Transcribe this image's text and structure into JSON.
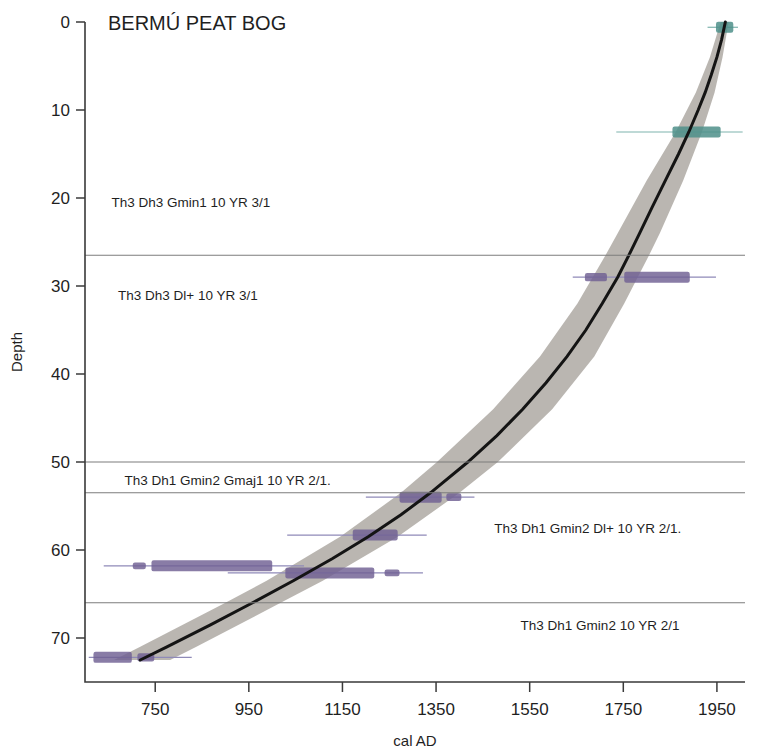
{
  "title": "BERMÚ PEAT BOG",
  "axes": {
    "x": {
      "label": "cal AD",
      "ticks": [
        750,
        950,
        1150,
        1350,
        1550,
        1750,
        1950
      ],
      "min": 600,
      "max": 2010
    },
    "y": {
      "label": "Depth",
      "ticks": [
        0,
        10,
        20,
        30,
        40,
        50,
        60,
        70
      ],
      "min": 0,
      "max": 75
    }
  },
  "stratigraphy": {
    "boundaries": [
      26.5,
      50.0,
      53.5,
      66.0
    ],
    "units": [
      {
        "label": "Th3 Dh3 Gmin1 10 YR 3/1",
        "depth_label": 20.5,
        "align": "left",
        "x_frac": 0.04
      },
      {
        "label": "Th3 Dh3 Dl+ 10 YR 3/1",
        "depth_label": 31.0,
        "align": "left",
        "x_frac": 0.05
      },
      {
        "label": "Th3 Dh1 Gmin2 Gmaj1 10 YR 2/1.",
        "depth_label": 52.0,
        "align": "left",
        "x_frac": 0.06
      },
      {
        "label": "Th3 Dh1 Gmin2 Dl+ 10 YR 2/1.",
        "depth_label": 57.5,
        "align": "left",
        "x_frac": 0.62
      },
      {
        "label": "Th3 Dh1 Gmin2 10 YR 2/1",
        "depth_label": 68.5,
        "align": "left",
        "x_frac": 0.66
      }
    ]
  },
  "legend_note": "",
  "colors": {
    "band": "#b0aca6",
    "median": "#141414",
    "date_purple": "#6f5f93",
    "date_purple_line": "#8f8ab8",
    "date_teal": "#4d8f8a",
    "date_teal_line": "#7fb3ae",
    "axis": "#3a3a3a",
    "strat_line": "#7d7d7d"
  },
  "chart_data": {
    "type": "line",
    "title": "BERMÚ PEAT BOG",
    "subtitle": "",
    "xlabel": "cal AD",
    "ylabel": "Depth",
    "xlim": [
      600,
      2010
    ],
    "ylim": [
      75,
      0
    ],
    "y_inverted": true,
    "grid": false,
    "legend": "none",
    "series": [
      {
        "name": "median age-depth model",
        "kind": "line",
        "points": [
          {
            "depth": 0,
            "age": 1968
          },
          {
            "depth": 2,
            "age": 1960
          },
          {
            "depth": 4,
            "age": 1950
          },
          {
            "depth": 6,
            "age": 1938
          },
          {
            "depth": 8,
            "age": 1925
          },
          {
            "depth": 10,
            "age": 1910
          },
          {
            "depth": 12.5,
            "age": 1890
          },
          {
            "depth": 15,
            "age": 1868
          },
          {
            "depth": 18,
            "age": 1840
          },
          {
            "depth": 21,
            "age": 1812
          },
          {
            "depth": 24,
            "age": 1785
          },
          {
            "depth": 26.5,
            "age": 1762
          },
          {
            "depth": 29,
            "age": 1738
          },
          {
            "depth": 32,
            "age": 1705
          },
          {
            "depth": 35,
            "age": 1670
          },
          {
            "depth": 38,
            "age": 1630
          },
          {
            "depth": 41,
            "age": 1585
          },
          {
            "depth": 44,
            "age": 1535
          },
          {
            "depth": 47,
            "age": 1480
          },
          {
            "depth": 50,
            "age": 1418
          },
          {
            "depth": 53.5,
            "age": 1338
          },
          {
            "depth": 56,
            "age": 1275
          },
          {
            "depth": 58.5,
            "age": 1205
          },
          {
            "depth": 61,
            "age": 1128
          },
          {
            "depth": 63.5,
            "age": 1045
          },
          {
            "depth": 66,
            "age": 958
          },
          {
            "depth": 68.5,
            "age": 868
          },
          {
            "depth": 71,
            "age": 775
          },
          {
            "depth": 72.5,
            "age": 718
          }
        ]
      },
      {
        "name": "95% confidence envelope",
        "kind": "band",
        "points": [
          {
            "depth": 0,
            "lower": 1958,
            "upper": 1975
          },
          {
            "depth": 4,
            "lower": 1935,
            "upper": 1962
          },
          {
            "depth": 8,
            "lower": 1905,
            "upper": 1945
          },
          {
            "depth": 12.5,
            "lower": 1862,
            "upper": 1918
          },
          {
            "depth": 18,
            "lower": 1800,
            "upper": 1878
          },
          {
            "depth": 24,
            "lower": 1738,
            "upper": 1828
          },
          {
            "depth": 26.5,
            "lower": 1712,
            "upper": 1805
          },
          {
            "depth": 32,
            "lower": 1652,
            "upper": 1752
          },
          {
            "depth": 38,
            "lower": 1572,
            "upper": 1688
          },
          {
            "depth": 44,
            "lower": 1472,
            "upper": 1598
          },
          {
            "depth": 50,
            "lower": 1352,
            "upper": 1482
          },
          {
            "depth": 53.5,
            "lower": 1275,
            "upper": 1400
          },
          {
            "depth": 58.5,
            "lower": 1145,
            "upper": 1268
          },
          {
            "depth": 63.5,
            "lower": 988,
            "upper": 1108
          },
          {
            "depth": 66,
            "lower": 900,
            "upper": 1018
          },
          {
            "depth": 71,
            "lower": 718,
            "upper": 838
          },
          {
            "depth": 72.5,
            "lower": 662,
            "upper": 782
          }
        ]
      }
    ],
    "dated_levels": [
      {
        "id": "date-12",
        "depth": 12.5,
        "color": "teal",
        "range_min": 1735,
        "range_max": 2005,
        "modes": [
          {
            "from": 1855,
            "to": 1958,
            "height": 1.0
          }
        ]
      },
      {
        "id": "date-0",
        "depth": 0.6,
        "color": "teal",
        "range_min": 1930,
        "range_max": 1995,
        "modes": [
          {
            "from": 1948,
            "to": 1985,
            "height": 1.0
          }
        ]
      },
      {
        "id": "date-29",
        "depth": 29.0,
        "color": "purple",
        "range_min": 1642,
        "range_max": 1948,
        "modes": [
          {
            "from": 1668,
            "to": 1715,
            "height": 0.75
          },
          {
            "from": 1752,
            "to": 1892,
            "height": 1.0
          }
        ]
      },
      {
        "id": "date-54",
        "depth": 54.0,
        "color": "purple",
        "range_min": 1200,
        "range_max": 1432,
        "modes": [
          {
            "from": 1272,
            "to": 1362,
            "height": 1.0
          },
          {
            "from": 1372,
            "to": 1404,
            "height": 0.7
          }
        ]
      },
      {
        "id": "date-58",
        "depth": 58.3,
        "color": "purple",
        "range_min": 1032,
        "range_max": 1330,
        "modes": [
          {
            "from": 1172,
            "to": 1268,
            "height": 1.0
          }
        ]
      },
      {
        "id": "date-62a",
        "depth": 61.8,
        "color": "purple",
        "range_min": 640,
        "range_max": 1068,
        "modes": [
          {
            "from": 702,
            "to": 730,
            "height": 0.6
          },
          {
            "from": 742,
            "to": 1000,
            "height": 1.0
          }
        ]
      },
      {
        "id": "date-62b",
        "depth": 62.6,
        "color": "purple",
        "range_min": 905,
        "range_max": 1322,
        "modes": [
          {
            "from": 1028,
            "to": 1218,
            "height": 1.0
          },
          {
            "from": 1240,
            "to": 1272,
            "height": 0.6
          }
        ]
      },
      {
        "id": "date-72",
        "depth": 72.2,
        "color": "purple",
        "range_min": 608,
        "range_max": 828,
        "modes": [
          {
            "from": 618,
            "to": 700,
            "height": 1.0
          },
          {
            "from": 712,
            "to": 748,
            "height": 0.75
          }
        ]
      }
    ]
  }
}
